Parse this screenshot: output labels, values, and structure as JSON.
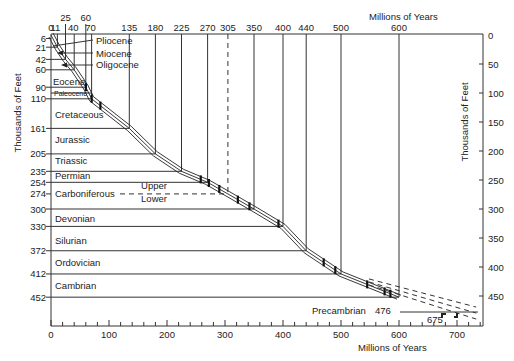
{
  "chart_data": {
    "type": "line",
    "title": "",
    "xlabel": "Millions of Years",
    "ylabel": "Thousands of Feet",
    "xlim": [
      0,
      740
    ],
    "ylim": [
      0,
      505
    ],
    "y_inverted": true,
    "grid": false,
    "bottom_x_ticks": [
      0,
      100,
      200,
      300,
      400,
      500,
      600,
      700
    ],
    "top_x_ticks_row1": [
      25,
      60
    ],
    "top_x_ticks_row2": [
      0,
      11,
      40,
      70,
      135,
      180,
      225,
      270,
      305,
      350,
      400,
      440,
      500,
      600
    ],
    "left_y_ticks": [
      6,
      21,
      42,
      60,
      90,
      110,
      161,
      205,
      235,
      254,
      274,
      300,
      330,
      372,
      412,
      452
    ],
    "right_y_ticks": [
      0,
      50,
      100,
      150,
      200,
      250,
      300,
      350,
      400,
      450
    ],
    "series": [
      {
        "name": "Cumulative sediment thickness vs. age",
        "x": [
          0,
          11,
          25,
          40,
          60,
          70,
          135,
          180,
          225,
          270,
          305,
          350,
          400,
          440,
          500,
          600
        ],
        "y": [
          0,
          21,
          42,
          60,
          90,
          110,
          161,
          205,
          235,
          254,
          274,
          300,
          330,
          372,
          412,
          452
        ]
      }
    ],
    "periods": [
      {
        "name": "Pliocene",
        "base_age_my": 11,
        "base_depth_kft": 21
      },
      {
        "name": "Miocene",
        "base_age_my": 25,
        "base_depth_kft": 42
      },
      {
        "name": "Oligocene",
        "base_age_my": 40,
        "base_depth_kft": 60
      },
      {
        "name": "Eocene",
        "base_age_my": 60,
        "base_depth_kft": 90
      },
      {
        "name": "Paleocene",
        "base_age_my": 70,
        "base_depth_kft": 110
      },
      {
        "name": "Cretaceous",
        "base_age_my": 135,
        "base_depth_kft": 161
      },
      {
        "name": "Jurassic",
        "base_age_my": 180,
        "base_depth_kft": 205
      },
      {
        "name": "Triassic",
        "base_age_my": 225,
        "base_depth_kft": 235
      },
      {
        "name": "Permian",
        "base_age_my": 270,
        "base_depth_kft": 254
      },
      {
        "name": "Carboniferous",
        "base_age_my": 350,
        "base_depth_kft": 300,
        "upper_lower_boundary": {
          "age_my": 305,
          "depth_kft": 274
        }
      },
      {
        "name": "Devonian",
        "base_age_my": 400,
        "base_depth_kft": 330
      },
      {
        "name": "Silurian",
        "base_age_my": 440,
        "base_depth_kft": 372
      },
      {
        "name": "Ordovician",
        "base_age_my": 500,
        "base_depth_kft": 412
      },
      {
        "name": "Cambrian",
        "base_age_my": 600,
        "base_depth_kft": 452
      }
    ],
    "subdivisions": {
      "upper": "Upper",
      "lower": "Lower"
    },
    "precambrian": {
      "name": "Precambrian",
      "depth_label": "476",
      "depth_kft": 476,
      "age_label": "675",
      "age_my": 675
    },
    "extrapolation_end_my": 740,
    "sample_markers_my": [
      60,
      70,
      85,
      258,
      272,
      290,
      322,
      342,
      392,
      470,
      490,
      545,
      575,
      585
    ]
  }
}
